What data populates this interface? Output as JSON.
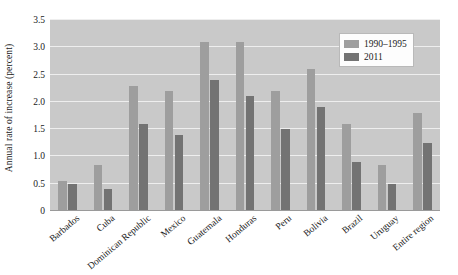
{
  "chart_data": {
    "type": "bar",
    "title": "",
    "xlabel": "",
    "ylabel": "Annual rate of increase (percent)",
    "ylim": [
      0,
      3.5
    ],
    "yticks": [
      "0",
      "0.5",
      "1.0",
      "1.5",
      "2.0",
      "2.5",
      "3.0",
      "3.5"
    ],
    "ytick_values": [
      0,
      0.5,
      1.0,
      1.5,
      2.0,
      2.5,
      3.0,
      3.5
    ],
    "grid": true,
    "legend_position": "top-right",
    "categories": [
      "Barbados",
      "Cuba",
      "Dominican Republic",
      "Mexico",
      "Guatemala",
      "Honduras",
      "Peru",
      "Bolivia",
      "Brazil",
      "Uruguay",
      "Entire region"
    ],
    "series": [
      {
        "name": "1990–1995",
        "color": "#9e9e9e",
        "values": [
          0.55,
          0.85,
          2.3,
          2.2,
          3.1,
          3.1,
          2.2,
          2.6,
          1.6,
          0.85,
          1.8
        ]
      },
      {
        "name": "2011",
        "color": "#737373",
        "values": [
          0.5,
          0.4,
          1.6,
          1.4,
          2.4,
          2.1,
          1.5,
          1.9,
          0.9,
          0.5,
          1.25
        ]
      }
    ],
    "plot_background": "#c9c9c9",
    "gridline_color": "#eeeeee"
  }
}
